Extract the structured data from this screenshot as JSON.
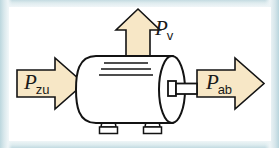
{
  "diagram": {
    "type": "power-flow-diagram",
    "machine": {
      "name": "electric-motor",
      "body_shape": "horizontal-cylinder",
      "cooling_fin_count": 3,
      "foot_count": 2,
      "has_shaft": true,
      "body_fill": "#ffffff",
      "outline_color": "#131313"
    },
    "arrows": [
      {
        "id": "p-zu",
        "symbol": "P",
        "subscript": "zu",
        "meaning": "zugefuehrte Leistung",
        "direction": "right",
        "position": "left",
        "fill": "#f7e7c6",
        "stroke": "#131313"
      },
      {
        "id": "p-v",
        "symbol": "P",
        "subscript": "v",
        "meaning": "Verlustleistung",
        "direction": "up",
        "position": "top",
        "fill": "#f7e7c6",
        "stroke": "#131313"
      },
      {
        "id": "p-ab",
        "symbol": "P",
        "subscript": "ab",
        "meaning": "abgegebene Leistung",
        "direction": "right",
        "position": "right",
        "fill": "#f7e7c6",
        "stroke": "#131313"
      }
    ],
    "labels": {
      "p_zu": {
        "symbol": "P",
        "subscript": "zu"
      },
      "p_v": {
        "symbol": "P",
        "subscript": "v"
      },
      "p_ab": {
        "symbol": "P",
        "subscript": "ab"
      }
    },
    "colors": {
      "arrow_fill": "#f7e7c6",
      "ink": "#131313",
      "page": "#ffffff",
      "scan_border": "#cfe2e6"
    }
  }
}
